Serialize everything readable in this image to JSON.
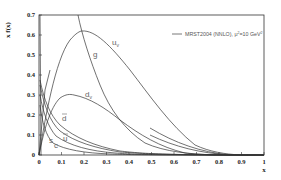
{
  "chart_data": {
    "type": "line",
    "title": "",
    "xlabel": "x",
    "ylabel": "x f(x)",
    "xlim": [
      0,
      1
    ],
    "ylim": [
      0,
      0.7
    ],
    "grid": false,
    "legend_position": "upper right",
    "legend": [
      "MRST2004 (NNLO), μ² = 10 GeV²"
    ],
    "x_ticks": [
      "0",
      "0.1",
      "0.2",
      "0.3",
      "0.4",
      "0.5",
      "0.6",
      "0.7",
      "0.8",
      "0.9",
      "1"
    ],
    "y_ticks": [
      "0",
      "0.1",
      "0.2",
      "0.3",
      "0.4",
      "0.5",
      "0.6",
      "0.7"
    ],
    "x": [
      0.001,
      0.01,
      0.02,
      0.05,
      0.1,
      0.15,
      0.2,
      0.25,
      0.3,
      0.4,
      0.5,
      0.6,
      0.7,
      0.8,
      0.9,
      1.0
    ],
    "series": [
      {
        "name": "u_v",
        "label": "uᵥ",
        "values": [
          0.0,
          0.08,
          0.14,
          0.29,
          0.48,
          0.6,
          0.63,
          0.61,
          0.57,
          0.45,
          0.31,
          0.18,
          0.08,
          0.02,
          0.004,
          0.0
        ]
      },
      {
        "name": "g",
        "label": "g",
        "values": [
          7.0,
          3.0,
          2.2,
          1.4,
          0.95,
          0.75,
          0.55,
          0.4,
          0.28,
          0.13,
          0.055,
          0.02,
          0.006,
          0.001,
          0.0,
          0.0
        ]
      },
      {
        "name": "d_v",
        "label": "dᵥ",
        "values": [
          0.0,
          0.05,
          0.09,
          0.18,
          0.28,
          0.3,
          0.29,
          0.27,
          0.24,
          0.17,
          0.1,
          0.05,
          0.02,
          0.005,
          0.001,
          0.0
        ]
      },
      {
        "name": "dbar",
        "label": "d̄",
        "values": [
          0.45,
          0.3,
          0.26,
          0.19,
          0.13,
          0.09,
          0.065,
          0.045,
          0.03,
          0.012,
          0.004,
          0.001,
          0.0,
          0.0,
          0.0,
          0.0
        ]
      },
      {
        "name": "ubar",
        "label": "ū",
        "values": [
          0.45,
          0.29,
          0.24,
          0.16,
          0.1,
          0.07,
          0.05,
          0.035,
          0.022,
          0.008,
          0.003,
          0.001,
          0.0,
          0.0,
          0.0,
          0.0
        ]
      },
      {
        "name": "s",
        "label": "s",
        "values": [
          0.4,
          0.24,
          0.19,
          0.12,
          0.07,
          0.045,
          0.03,
          0.02,
          0.012,
          0.004,
          0.001,
          0.0,
          0.0,
          0.0,
          0.0,
          0.0
        ]
      },
      {
        "name": "c",
        "label": "c",
        "values": [
          0.35,
          0.18,
          0.13,
          0.07,
          0.035,
          0.02,
          0.012,
          0.007,
          0.004,
          0.001,
          0.0,
          0.0,
          0.0,
          0.0,
          0.0,
          0.0
        ]
      }
    ]
  },
  "labels": {
    "ylabel": "x f(x)",
    "xlabel": "x",
    "legend": "MRST2004 (NNLO), μ",
    "legend_sup1": "2",
    "legend_mid": "=10 GeV",
    "legend_sup2": "2",
    "uv": "u",
    "uv_sub": "v",
    "g": "g",
    "dv": "d",
    "dv_sub": "v",
    "dbar": "d",
    "ubar": "u",
    "s": "s",
    "c": "c"
  }
}
